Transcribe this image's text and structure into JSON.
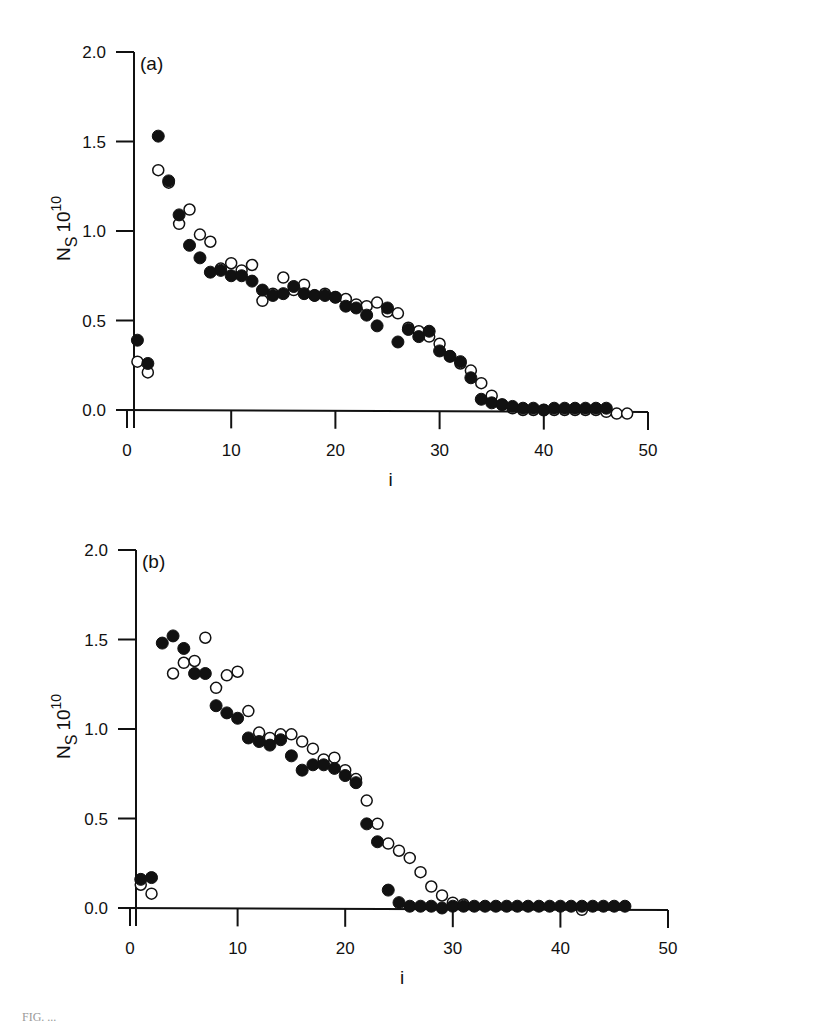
{
  "chart_data": [
    {
      "type": "scatter",
      "panel_label": "(a)",
      "title": "",
      "xlabel": "i",
      "ylabel": "N_S 10^10",
      "ylabel_parts": {
        "main": "N",
        "sub": "S",
        "mult": "10",
        "exp": "10"
      },
      "xlim": [
        0,
        50
      ],
      "ylim": [
        0,
        2.0
      ],
      "xticks": [
        0,
        10,
        20,
        30,
        40,
        50
      ],
      "xtick_labels": [
        "0",
        "10",
        "20",
        "30",
        "40",
        "50"
      ],
      "yticks": [
        0,
        0.5,
        1.0,
        1.5,
        2.0
      ],
      "ytick_labels": [
        "0.0",
        "0.5",
        "1.0",
        "1.5",
        "2.0"
      ],
      "grid": false,
      "legend": null,
      "series": [
        {
          "name": "filled",
          "marker": "filled-circle",
          "x": [
            1,
            2,
            3,
            4,
            5,
            6,
            7,
            8,
            9,
            10,
            11,
            12,
            13,
            14,
            15,
            16,
            17,
            18,
            19,
            20,
            21,
            22,
            23,
            24,
            25,
            26,
            27,
            28,
            29,
            30,
            31,
            32,
            33,
            34,
            35,
            36,
            37,
            38,
            39,
            40,
            41,
            42,
            43,
            44,
            45,
            46
          ],
          "values": [
            0.39,
            0.26,
            1.53,
            1.28,
            1.09,
            0.92,
            0.85,
            0.77,
            0.78,
            0.75,
            0.75,
            0.72,
            0.67,
            0.64,
            0.65,
            0.69,
            0.65,
            0.64,
            0.64,
            0.63,
            0.58,
            0.57,
            0.53,
            0.47,
            0.57,
            0.38,
            0.45,
            0.41,
            0.44,
            0.33,
            0.3,
            0.27,
            0.18,
            0.06,
            0.04,
            0.03,
            0.02,
            0.01,
            0.01,
            0.0,
            0.01,
            0.01,
            0.01,
            0.01,
            0.01,
            0.01
          ]
        },
        {
          "name": "open",
          "marker": "open-circle",
          "x": [
            1,
            2,
            3,
            4,
            5,
            6,
            7,
            8,
            9,
            10,
            11,
            12,
            13,
            14,
            15,
            16,
            17,
            18,
            19,
            20,
            21,
            22,
            23,
            24,
            25,
            26,
            27,
            28,
            29,
            30,
            31,
            32,
            33,
            34,
            35,
            36,
            37,
            38,
            39,
            40,
            41,
            42,
            43,
            44,
            45,
            46,
            47,
            48
          ],
          "values": [
            0.27,
            0.21,
            1.34,
            1.27,
            1.04,
            1.12,
            0.98,
            0.94,
            0.79,
            0.82,
            0.78,
            0.81,
            0.61,
            0.65,
            0.74,
            0.67,
            0.7,
            0.64,
            0.65,
            0.63,
            0.62,
            0.59,
            0.58,
            0.6,
            0.55,
            0.54,
            0.46,
            0.44,
            0.41,
            0.37,
            0.3,
            0.26,
            0.22,
            0.15,
            0.08,
            0.03,
            0.01,
            0.0,
            0.0,
            0.0,
            0.0,
            0.0,
            0.0,
            0.0,
            0.0,
            -0.01,
            -0.02,
            -0.02
          ]
        }
      ]
    },
    {
      "type": "scatter",
      "panel_label": "(b)",
      "title": "",
      "xlabel": "i",
      "ylabel": "N_S 10^10",
      "ylabel_parts": {
        "main": "N",
        "sub": "S",
        "mult": "10",
        "exp": "10"
      },
      "xlim": [
        0,
        50
      ],
      "ylim": [
        0,
        2.0
      ],
      "xticks": [
        0,
        10,
        20,
        30,
        40,
        50
      ],
      "xtick_labels": [
        "0",
        "10",
        "20",
        "30",
        "40",
        "50"
      ],
      "yticks": [
        0,
        0.5,
        1.0,
        1.5,
        2.0
      ],
      "ytick_labels": [
        "0.0",
        "0.5",
        "1.0",
        "1.5",
        "2.0"
      ],
      "grid": false,
      "legend": null,
      "series": [
        {
          "name": "filled",
          "marker": "filled-circle",
          "x": [
            1,
            2,
            3,
            4,
            5,
            6,
            7,
            8,
            9,
            10,
            11,
            12,
            13,
            14,
            15,
            16,
            17,
            18,
            19,
            20,
            21,
            22,
            23,
            24,
            25,
            26,
            27,
            28,
            29,
            30,
            31,
            32,
            33,
            34,
            35,
            36,
            37,
            38,
            39,
            40,
            41,
            42,
            43,
            44,
            45,
            46
          ],
          "values": [
            0.16,
            0.17,
            1.48,
            1.52,
            1.45,
            1.31,
            1.31,
            1.13,
            1.09,
            1.06,
            0.95,
            0.93,
            0.91,
            0.94,
            0.85,
            0.77,
            0.8,
            0.8,
            0.78,
            0.74,
            0.7,
            0.47,
            0.37,
            0.1,
            0.03,
            0.01,
            0.01,
            0.01,
            0.0,
            0.01,
            0.01,
            0.01,
            0.01,
            0.01,
            0.01,
            0.01,
            0.01,
            0.01,
            0.01,
            0.01,
            0.01,
            0.01,
            0.01,
            0.01,
            0.01,
            0.01
          ]
        },
        {
          "name": "open",
          "marker": "open-circle",
          "x": [
            1,
            2,
            4,
            5,
            6,
            7,
            8,
            9,
            10,
            11,
            12,
            13,
            14,
            15,
            16,
            17,
            18,
            19,
            20,
            21,
            22,
            23,
            24,
            25,
            26,
            27,
            28,
            29,
            30,
            31,
            42
          ],
          "values": [
            0.13,
            0.08,
            1.31,
            1.37,
            1.38,
            1.51,
            1.23,
            1.3,
            1.32,
            1.1,
            0.98,
            0.95,
            0.97,
            0.97,
            0.93,
            0.89,
            0.83,
            0.84,
            0.77,
            0.72,
            0.6,
            0.47,
            0.36,
            0.32,
            0.28,
            0.2,
            0.12,
            0.07,
            0.03,
            0.02,
            -0.01
          ]
        }
      ]
    }
  ],
  "caption": {
    "text": "FIG. ..."
  }
}
